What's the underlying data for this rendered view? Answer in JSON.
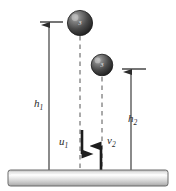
{
  "figure": {
    "background_color": "#ffffff",
    "width": 176,
    "height": 191
  },
  "labels": {
    "h1": {
      "base": "h",
      "sub": "1"
    },
    "h2": {
      "base": "h",
      "sub": "2"
    },
    "u1": {
      "base": "u",
      "sub": "1"
    },
    "v2": {
      "base": "v",
      "sub": "2"
    }
  },
  "balls": [
    {
      "id": "ball-top",
      "marking": "3",
      "cx": 80,
      "cy": 23,
      "r": 13,
      "color": "#4a4a4a"
    },
    {
      "id": "ball-lower",
      "marking": "3",
      "cx": 102,
      "cy": 65,
      "r": 11,
      "color": "#4a4a4a"
    }
  ],
  "measure_lines": [
    {
      "id": "h1",
      "x": 49,
      "y_top": 24,
      "y_bottom": 170,
      "tick_x1": 40,
      "tick_x2": 63,
      "tick_y": 22
    },
    {
      "id": "h2",
      "x": 131,
      "y_top": 71,
      "y_bottom": 170,
      "tick_x1": 122,
      "tick_x2": 146,
      "tick_y": 69
    }
  ],
  "velocity_arrows": [
    {
      "id": "u1",
      "direction": "down",
      "x": 82,
      "y_start": 130,
      "y_end": 166
    },
    {
      "id": "v2",
      "direction": "up",
      "x": 101,
      "y_start": 170,
      "y_end": 134
    }
  ],
  "dashed_lines": [
    {
      "id": "dash-ball-top",
      "x": 80,
      "y_top": 36,
      "y_bottom": 170
    },
    {
      "id": "dash-ball-lower",
      "x": 102,
      "y_top": 76,
      "y_bottom": 170
    }
  ],
  "ground": {
    "id": "ground-bar",
    "x": 8,
    "y": 170,
    "width": 160,
    "height": 16,
    "color_light": "#f2f2f2",
    "color_mid": "#d9d9d9",
    "color_dark": "#a8a8a8",
    "border_color": "#6b6b6b"
  },
  "colors": {
    "stroke": "#2b2b2b",
    "dash": "#555555",
    "ball_dark": "#2f2f2f",
    "ball_light": "#9a9a9a"
  }
}
